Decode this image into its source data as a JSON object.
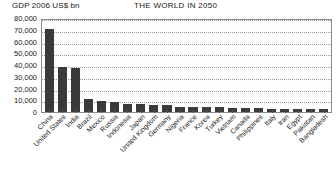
{
  "axis_title": "GDP 2006 US$ bn",
  "chart_title": "THE WORLD IN 2050",
  "colors": {
    "bar": "#3a3a3a",
    "grid": "#9a9a9a",
    "axis": "#8c8c8c",
    "text": "#1a1a1a",
    "background": "#ffffff"
  },
  "chart_data": {
    "type": "bar",
    "title": "THE WORLD IN 2050",
    "xlabel": "",
    "ylabel": "GDP 2006 US$ bn",
    "ylim": [
      0,
      80000
    ],
    "ytick_labels": [
      "80,000",
      "70,000",
      "60,000",
      "50,000",
      "40,000",
      "30,000",
      "20,000",
      "10,000",
      "0"
    ],
    "ytick_values": [
      80000,
      70000,
      60000,
      50000,
      40000,
      30000,
      20000,
      10000,
      0
    ],
    "grid": true,
    "legend": false,
    "categories": [
      "China",
      "United States",
      "India",
      "Brazil",
      "Mexico",
      "Russia",
      "Indonesia",
      "Japan",
      "United Kingdom",
      "Germany",
      "Nigeria",
      "France",
      "Korea",
      "Turkey",
      "Vietnam",
      "Canada",
      "Philippines",
      "Italy",
      "Iran",
      "Egypt",
      "Pakistan",
      "Bangladesh"
    ],
    "values": [
      70710,
      38514,
      37668,
      11366,
      9340,
      8580,
      7010,
      6677,
      6194,
      5822,
      4640,
      4592,
      4083,
      3943,
      3607,
      3149,
      3010,
      2950,
      2800,
      2650,
      2500,
      2350
    ]
  }
}
